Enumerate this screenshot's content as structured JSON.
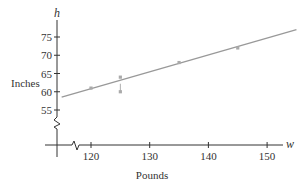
{
  "chart_data": {
    "type": "scatter",
    "title": "",
    "xlabel": "Pounds",
    "ylabel": "Inches",
    "x_var": "w",
    "y_var": "h",
    "x_ticks": [
      120,
      130,
      140,
      150
    ],
    "y_ticks": [
      55,
      60,
      65,
      70,
      75
    ],
    "xlim": [
      113,
      156
    ],
    "ylim": [
      50,
      80
    ],
    "axis_breaks": {
      "x": true,
      "y": true
    },
    "grid": false,
    "legend": null,
    "points": [
      {
        "x": 120,
        "y": 61
      },
      {
        "x": 125,
        "y": 64
      },
      {
        "x": 125,
        "y": 60
      },
      {
        "x": 135,
        "y": 68
      },
      {
        "x": 145,
        "y": 72
      }
    ],
    "fit_line": {
      "x": [
        115,
        155
      ],
      "y": [
        58.5,
        77
      ]
    },
    "colors": {
      "axis": "#333333",
      "line": "#999999",
      "point": "#aaaaaa"
    }
  }
}
